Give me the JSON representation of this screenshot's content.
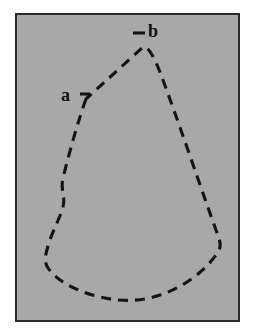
{
  "figure": {
    "kind": "line-drawing",
    "frame": {
      "background_color": "#a8a8a8",
      "border_color": "#2b2b2b",
      "border_width_px": 2,
      "x": 15,
      "y": 13,
      "width": 225,
      "height": 309
    },
    "page_background_color": "#ffffff",
    "stroke": {
      "color": "#141414",
      "width_px": 3.1,
      "dash_px": 10,
      "gap_px": 7
    },
    "contour_path": "M 86 99 C 79 118 70 150 63 178 C 60 190 66 196 63 207 C 60 218 52 232 48 246 C 45 256 44 262 48 268 C 56 280 74 290 96 296 C 118 302 140 302 160 295 C 182 288 205 272 218 252 C 222 246 220 240 216 230 C 205 200 178 120 160 72 C 152 52 147 46 143 47 Z",
    "labels": [
      {
        "id": "a",
        "text": "a",
        "x": 61,
        "y": 86,
        "tick": {
          "x1": 80,
          "y1": 94,
          "x2": 90,
          "y2": 94
        }
      },
      {
        "id": "b",
        "text": "b",
        "x": 148,
        "y": 22,
        "tick": {
          "x1": 133,
          "y1": 33,
          "x2": 145,
          "y2": 33
        }
      }
    ]
  }
}
